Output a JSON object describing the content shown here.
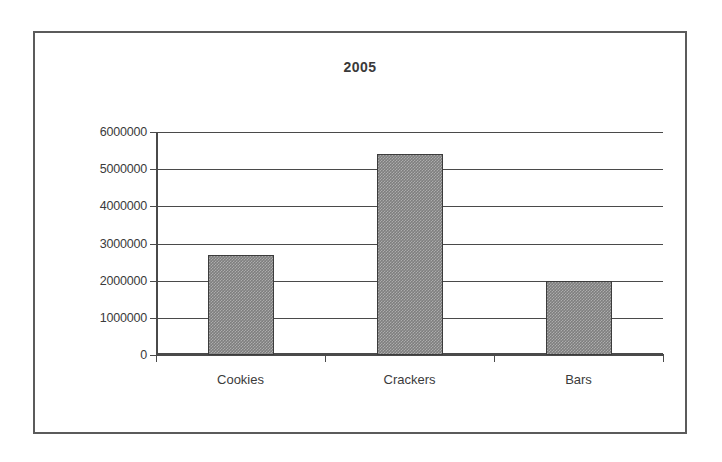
{
  "chart_data": {
    "type": "bar",
    "title": "2005",
    "xlabel": "",
    "ylabel": "",
    "categories": [
      "Cookies",
      "Crackers",
      "Bars"
    ],
    "values": [
      2700000,
      5400000,
      2000000
    ],
    "ylim": [
      0,
      6000000
    ],
    "ytick_labels": [
      "6000000",
      "5000000",
      "4000000",
      "3000000",
      "2000000",
      "1000000",
      "0"
    ],
    "ytick_values": [
      6000000,
      5000000,
      4000000,
      3000000,
      2000000,
      1000000,
      0
    ],
    "grid": true,
    "legend": "none",
    "bar_color": "#7e7e7e",
    "bar_border_color": "#3c3c3c",
    "axis_color": "#4a4a4a",
    "frame_color": "#5b5b5b",
    "text_color": "#3b3b3b"
  }
}
